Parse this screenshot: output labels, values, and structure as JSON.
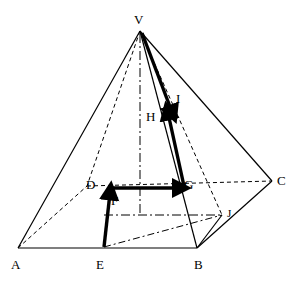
{
  "figure": {
    "type": "geometry-diagram",
    "background_color": "#ffffff",
    "stroke_color": "#000000",
    "width": 296,
    "height": 281
  },
  "labels": {
    "V": "V",
    "A": "A",
    "B": "B",
    "C": "C",
    "D": "D",
    "E": "E",
    "F": "F",
    "G": "G",
    "H": "H",
    "I": "I",
    "J": "J"
  },
  "points": {
    "V": [
      140,
      31
    ],
    "A": [
      18,
      248
    ],
    "B": [
      197,
      248
    ],
    "C": [
      272,
      181
    ],
    "D": [
      87,
      186
    ],
    "E": [
      103,
      248
    ],
    "F": [
      110,
      190
    ],
    "G": [
      183,
      187
    ],
    "H": [
      163,
      126
    ],
    "I": [
      172,
      107
    ],
    "J": [
      222,
      215
    ]
  },
  "label_positions": {
    "V": [
      134,
      14
    ],
    "A": [
      11,
      258
    ],
    "B": [
      194,
      258
    ],
    "C": [
      277,
      174
    ],
    "D": [
      86,
      178
    ],
    "E": [
      96,
      258
    ],
    "F": [
      111,
      194
    ],
    "G": [
      184,
      178
    ],
    "H": [
      146,
      110
    ],
    "I": [
      176,
      92
    ],
    "J": [
      227,
      208
    ]
  },
  "edges": {
    "solid": [
      {
        "name": "VA",
        "from": "V",
        "to": "A"
      },
      {
        "name": "VB",
        "from": "V",
        "to": "B"
      },
      {
        "name": "VC",
        "from": "V",
        "to": "C"
      },
      {
        "name": "AB",
        "from": "A",
        "to": "B"
      },
      {
        "name": "BC",
        "from": "B",
        "to": "C"
      }
    ],
    "dashed": [
      {
        "name": "VD",
        "from": "V",
        "to": "D"
      },
      {
        "name": "AD",
        "from": "A",
        "to": "D"
      },
      {
        "name": "DC",
        "from": "D",
        "to": "C"
      }
    ]
  },
  "arrows": [
    {
      "name": "EF",
      "from": "E",
      "to": "F",
      "label": "F"
    },
    {
      "name": "DG",
      "from": "D",
      "to": "G",
      "label": "G"
    },
    {
      "name": "GI",
      "from": "G",
      "to": "I",
      "label": "I"
    },
    {
      "name": "VH",
      "from": "V",
      "to": "H",
      "label": "H"
    }
  ],
  "axis_lines": {
    "style": "dash-dot",
    "items": [
      {
        "name": "vertical-axis",
        "from": [
          140,
          31
        ],
        "to": [
          140,
          215
        ]
      },
      {
        "name": "horizontal-axis",
        "from": [
          103,
          215
        ],
        "to": [
          222,
          215
        ]
      },
      {
        "name": "diagonal-axis",
        "from": [
          103,
          248
        ],
        "to": [
          222,
          215
        ]
      }
    ]
  }
}
